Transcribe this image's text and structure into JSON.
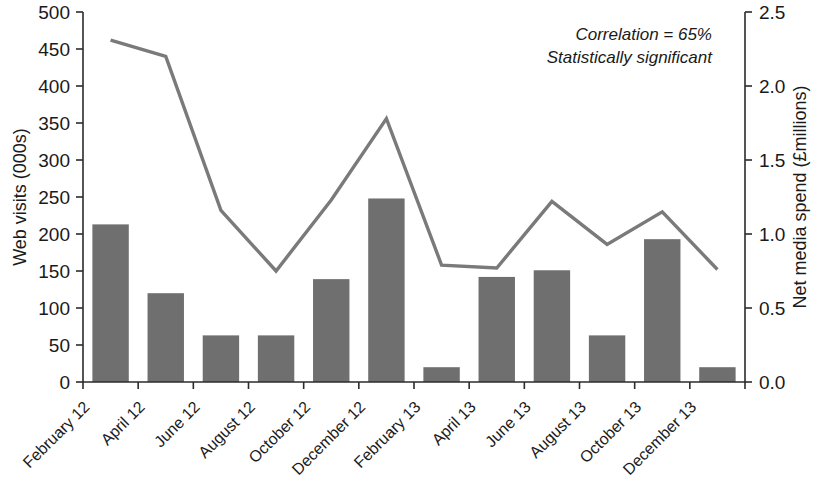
{
  "chart_data": {
    "type": "bar",
    "title": "",
    "subtitle": "",
    "categories": [
      "February 12",
      "April 12",
      "June 12",
      "August 12",
      "October 12",
      "December 12",
      "February 13",
      "April 13",
      "June 13",
      "August 13",
      "October 13",
      "December 13"
    ],
    "series": [
      {
        "name": "Web visits (000s)",
        "type": "bar",
        "axis": "left",
        "values": [
          213,
          120,
          63,
          63,
          139,
          248,
          20,
          142,
          151,
          63,
          193,
          20
        ]
      },
      {
        "name": "Net media spend (£millions)",
        "type": "line",
        "axis": "right",
        "values": [
          2.31,
          2.2,
          1.16,
          0.75,
          1.23,
          1.78,
          0.79,
          0.77,
          1.22,
          0.93,
          1.15,
          0.76
        ]
      }
    ],
    "xlabel": "",
    "ylabel": "Web visits (000s)",
    "y2label": "Net media spend (£millions)",
    "ylim": [
      0,
      500
    ],
    "y2lim": [
      0,
      2.5
    ],
    "yticks": [
      0,
      50,
      100,
      150,
      200,
      250,
      300,
      350,
      400,
      450,
      500
    ],
    "ytick_labels": [
      "0",
      "50",
      "100",
      "150",
      "200",
      "250",
      "300",
      "350",
      "400",
      "450",
      "500"
    ],
    "y2ticks": [
      0.0,
      0.5,
      1.0,
      1.5,
      2.0,
      2.5
    ],
    "y2tick_labels": [
      "0.0",
      "0.5",
      "1.0",
      "1.5",
      "2.0",
      "2.5"
    ],
    "grid": false,
    "legend": "none",
    "annotations": [
      "Correlation = 65%",
      "Statistically significant"
    ],
    "colors": {
      "bar": "#6f6f6f",
      "line": "#7a7a7a",
      "axis": "#2b2b2b",
      "text": "#1a1a1a",
      "background": "#ffffff"
    }
  }
}
